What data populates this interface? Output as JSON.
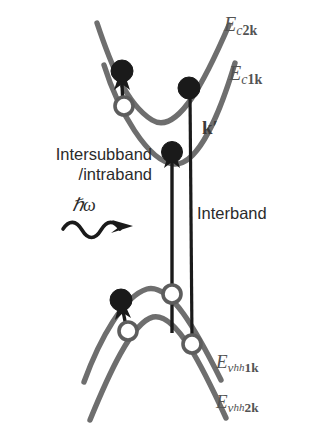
{
  "figure": {
    "type": "semiconductor-band-structure-diagram",
    "colors": {
      "band_curve": "#6e6e6e",
      "arrow": "#1a1a1a",
      "electron_fill": "#1a1a1a",
      "hole_fill": "#ffffff",
      "hole_stroke": "#5d5d5d",
      "background": "#ffffff",
      "label_text": "#2b2b2b"
    }
  },
  "labels": {
    "conduction_band_2": {
      "base": "E",
      "sub": "c",
      "sub_index": "2",
      "sub_k": "k"
    },
    "conduction_band_1": {
      "base": "E",
      "sub": "c",
      "sub_index": "1",
      "sub_k": "k"
    },
    "valence_band_hh1": {
      "base": "E",
      "sub": "v",
      "subsub": "hh",
      "sub_index": "1",
      "sub_k": "k"
    },
    "valence_band_hh2": {
      "base": "E",
      "sub": "v",
      "subsub": "hh",
      "sub_index": "2",
      "sub_k": "k"
    },
    "k_prime": "k′",
    "intersubband_line1": "Intersubband",
    "intersubband_line2": "/intraband",
    "interband": "Interband",
    "photon_energy": "ℏω"
  },
  "transitions": [
    {
      "name": "intersubband-intraband-conduction",
      "label": "Intersubband /intraband",
      "from": {
        "x": 124,
        "y": 105,
        "carrier": "hole"
      },
      "to": {
        "x": 122,
        "y": 72,
        "carrier": "electron"
      }
    },
    {
      "name": "interband-left",
      "label": "Interband",
      "from": {
        "x": 172,
        "y": 334,
        "carrier": "hole"
      },
      "to": {
        "x": 172,
        "y": 152,
        "carrier": "electron"
      }
    },
    {
      "name": "interband-right",
      "label": "Interband",
      "from": {
        "x": 191,
        "y": 343,
        "carrier": "hole"
      },
      "to": {
        "x": 189,
        "y": 88,
        "carrier": "electron"
      }
    },
    {
      "name": "intersubband-valence",
      "label": "Intersubband /intraband",
      "from": {
        "x": 128,
        "y": 330,
        "carrier": "hole"
      },
      "to": {
        "x": 122,
        "y": 301,
        "carrier": "electron"
      }
    }
  ],
  "markers": {
    "electrons": [
      {
        "name": "electron-c2k-left",
        "x": 122,
        "y": 72
      },
      {
        "name": "electron-c1k-right",
        "x": 189,
        "y": 88
      },
      {
        "name": "electron-c1k-bottom",
        "x": 172,
        "y": 152
      },
      {
        "name": "electron-vhh1k",
        "x": 122,
        "y": 301
      }
    ],
    "holes": [
      {
        "name": "hole-c1k-left",
        "x": 124,
        "y": 106
      },
      {
        "name": "hole-vhh1k-top",
        "x": 172,
        "y": 294
      },
      {
        "name": "hole-vhh2k-left",
        "x": 128,
        "y": 331
      },
      {
        "name": "hole-vhh2k-right",
        "x": 191,
        "y": 344
      }
    ]
  }
}
